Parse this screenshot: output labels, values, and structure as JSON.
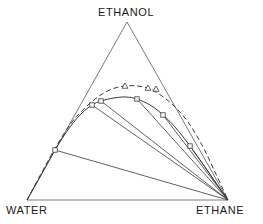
{
  "chart_data": {
    "type": "scatter",
    "title": "",
    "subtitle": "",
    "xlabel": "",
    "ylabel": "",
    "diagram_kind": "ternary-phase-diagram",
    "grid": false,
    "legend_position": "none",
    "vertices": [
      {
        "name": "ethanol-vertex",
        "label": "ETHANOL",
        "corner": "top",
        "px": [
          127,
          22
        ]
      },
      {
        "name": "water-vertex",
        "label": "WATER",
        "corner": "bottom-left",
        "px": [
          27,
          200
        ]
      },
      {
        "name": "ethane-vertex",
        "label": "ETHANE",
        "corner": "bottom-right",
        "px": [
          228,
          200
        ]
      }
    ],
    "axis_ranges": {
      "ethanol": [
        0,
        1
      ],
      "water": [
        0,
        1
      ],
      "ethane": [
        0,
        1
      ]
    },
    "series": [
      {
        "name": "binodal-solid-lower",
        "style": "solid",
        "marker": "circle-square",
        "points_px": [
          [
            27,
            200
          ],
          [
            40,
            177
          ],
          [
            55,
            150
          ],
          [
            70,
            127
          ],
          [
            82,
            113
          ],
          [
            92,
            105
          ],
          [
            101,
            101
          ],
          [
            114,
            98
          ],
          [
            126,
            97
          ],
          [
            137,
            99
          ],
          [
            150,
            105
          ],
          [
            162,
            114
          ],
          [
            175,
            127
          ],
          [
            190,
            146
          ],
          [
            205,
            167
          ],
          [
            218,
            186
          ],
          [
            228,
            200
          ]
        ],
        "marker_points_px": [
          [
            55,
            150
          ],
          [
            92,
            105
          ],
          [
            101,
            101
          ],
          [
            137,
            99
          ],
          [
            163,
            115
          ],
          [
            190,
            146
          ]
        ]
      },
      {
        "name": "binodal-dashed-upper",
        "style": "dashed",
        "marker": "triangle",
        "points_px": [
          [
            27,
            200
          ],
          [
            42,
            172
          ],
          [
            57,
            145
          ],
          [
            72,
            122
          ],
          [
            86,
            107
          ],
          [
            99,
            96
          ],
          [
            112,
            89
          ],
          [
            125,
            86
          ],
          [
            138,
            86
          ],
          [
            150,
            89
          ],
          [
            162,
            96
          ],
          [
            175,
            107
          ],
          [
            188,
            122
          ],
          [
            202,
            145
          ],
          [
            215,
            172
          ],
          [
            228,
            200
          ]
        ],
        "marker_points_px": [
          [
            125,
            86
          ],
          [
            148,
            88
          ],
          [
            156,
            89
          ]
        ]
      }
    ],
    "tie_lines_px": [
      [
        [
          55,
          150
        ],
        [
          228,
          200
        ]
      ],
      [
        [
          92,
          105
        ],
        [
          228,
          200
        ]
      ],
      [
        [
          101,
          101
        ],
        [
          228,
          200
        ]
      ],
      [
        [
          137,
          99
        ],
        [
          228,
          200
        ]
      ],
      [
        [
          163,
          115
        ],
        [
          228,
          200
        ]
      ],
      [
        [
          190,
          146
        ],
        [
          228,
          200
        ]
      ]
    ],
    "colors": {
      "line": "#3a3a3a",
      "triangle_frame": "#6b6b6b",
      "marker_fill": "#ffffff",
      "background": "#ffffff",
      "text": "#1a1a1a"
    }
  },
  "labels": {
    "ethanol": "ETHANOL",
    "water": "WATER",
    "ethane": "ETHANE"
  }
}
